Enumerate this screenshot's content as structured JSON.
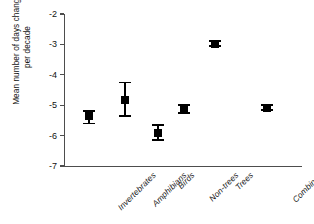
{
  "chart_data": {
    "type": "scatter",
    "title": "",
    "xlabel": "",
    "ylabel_line1": "Mean number of days changed",
    "ylabel_line2": "per decade",
    "ylim": [
      -7,
      -2
    ],
    "yticks": [
      "-2",
      "-3",
      "-4",
      "-5",
      "-6",
      "-7"
    ],
    "ytick_values": [
      -2,
      -3,
      -4,
      -5,
      -6,
      -7
    ],
    "grid": false,
    "legend": "none",
    "categories": [
      "Invertebrates",
      "Amphibians",
      "Birds",
      "Non-trees",
      "Trees",
      "Combined"
    ],
    "values": [
      -5.37,
      -4.83,
      -5.9,
      -5.13,
      -2.98,
      -5.08
    ],
    "error_low": [
      -5.6,
      -5.35,
      -6.15,
      -5.25,
      -3.05,
      -5.15
    ],
    "error_high": [
      -5.18,
      -4.25,
      -5.65,
      -5.0,
      -2.9,
      -5.0
    ],
    "marker_color": "#000000",
    "axis_color": "#4d4d4d",
    "background": "#ffffff",
    "series": [
      {
        "name": "Mean change",
        "points": [
          {
            "category": "Invertebrates",
            "value": -5.37,
            "low": -5.6,
            "high": -5.18
          },
          {
            "category": "Amphibians",
            "value": -4.83,
            "low": -5.35,
            "high": -4.25
          },
          {
            "category": "Birds",
            "value": -5.9,
            "low": -6.15,
            "high": -5.65
          },
          {
            "category": "Non-trees",
            "value": -5.13,
            "low": -5.25,
            "high": -5.0
          },
          {
            "category": "Trees",
            "value": -2.98,
            "low": -3.05,
            "high": -2.9
          },
          {
            "category": "Combined",
            "value": -5.08,
            "low": -5.15,
            "high": -5.0
          }
        ]
      }
    ]
  }
}
